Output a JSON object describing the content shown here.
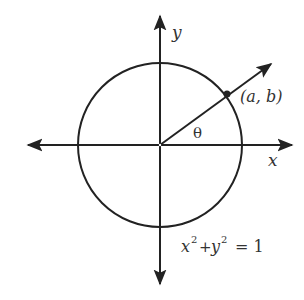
{
  "diagram": {
    "labels": {
      "y_axis": "y",
      "x_axis": "x",
      "point": "(a, b)",
      "angle": "θ",
      "equation_parts": {
        "x": "x",
        "x_exp": "2",
        "plus": "+",
        "y": "y",
        "y_exp": "2",
        "equals": "= 1"
      }
    },
    "elements": {
      "circle": "unit circle centered at origin",
      "ray": "ray from origin through point (a, b) on circle",
      "axes": "x and y axes with arrowheads in both directions"
    },
    "colors": {
      "stroke": "#222222",
      "text": "#333333",
      "background": "#ffffff"
    }
  }
}
